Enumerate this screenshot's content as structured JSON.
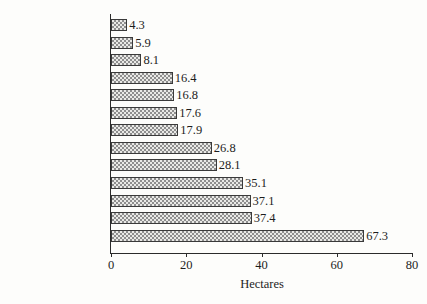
{
  "chart_data": {
    "type": "bar",
    "orientation": "horizontal",
    "title": "",
    "xlabel": "Hectares",
    "ylabel": "",
    "xlim": [
      0,
      80
    ],
    "xticks": [
      "0",
      "20",
      "40",
      "60",
      "80"
    ],
    "grid": false,
    "legend": null,
    "categories": [
      "Greece",
      "Italy",
      "Portugal",
      "EU12",
      "The Netherlands",
      "Belgium",
      "Spain",
      "Ireland",
      "Germany",
      "France",
      "Denmark",
      "Luxembourg",
      "UK"
    ],
    "values": [
      4.3,
      5.9,
      8.1,
      16.4,
      16.8,
      17.6,
      17.9,
      26.8,
      28.1,
      35.1,
      37.1,
      37.4,
      67.3
    ],
    "value_labels": [
      "4.3",
      "5.9",
      "8.1",
      "16.4",
      "16.8",
      "17.6",
      "17.9",
      "26.8",
      "28.1",
      "35.1",
      "37.1",
      "37.4",
      "67.3"
    ],
    "bar_fill": "#e9e9e6",
    "bar_pattern": "checkerboard-hatch",
    "bar_border": "#3a3a3a",
    "axis_color": "#2b2b2b",
    "background": "#fdfdfb"
  }
}
